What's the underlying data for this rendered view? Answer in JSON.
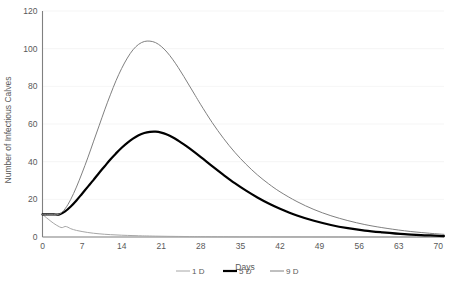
{
  "chart_data": {
    "type": "line",
    "title": "",
    "xlabel": "Days",
    "ylabel": "Number of Infectious Calves",
    "xlim": [
      0,
      71
    ],
    "ylim": [
      0,
      120
    ],
    "grid": true,
    "legend_position": "bottom",
    "xticks": [
      0,
      7,
      14,
      21,
      28,
      35,
      42,
      49,
      56,
      63,
      70
    ],
    "xtick_labels": [
      "0",
      "7",
      "14",
      "21",
      "28",
      "35",
      "42",
      "49",
      "56",
      "63",
      "70"
    ],
    "yticks": [
      0,
      20,
      40,
      60,
      80,
      100,
      120
    ],
    "ytick_labels": [
      "0",
      "20",
      "40",
      "60",
      "80",
      "100",
      "120"
    ],
    "series": [
      {
        "name": "1 D",
        "color": "#a6a6a6",
        "width": 1.0,
        "x": [
          0,
          1,
          2,
          3,
          3.5,
          4,
          4.5,
          5,
          6,
          7,
          8,
          9,
          10,
          11,
          12,
          13,
          14,
          15,
          16,
          17,
          18,
          20,
          22,
          24,
          26,
          28,
          32,
          36,
          42,
          50,
          60,
          71
        ],
        "values": [
          12,
          9.5,
          7.2,
          5.4,
          5.0,
          5.6,
          5.2,
          4.4,
          3.5,
          2.9,
          2.4,
          2.0,
          1.7,
          1.45,
          1.25,
          1.1,
          0.95,
          0.85,
          0.75,
          0.66,
          0.58,
          0.45,
          0.36,
          0.29,
          0.23,
          0.19,
          0.13,
          0.09,
          0.05,
          0.02,
          0.01,
          0.0
        ]
      },
      {
        "name": "5 D",
        "color": "#000000",
        "width": 2.2,
        "x": [
          0,
          1,
          2,
          3,
          4,
          5,
          6,
          7,
          8,
          9,
          10,
          11,
          12,
          13,
          14,
          15,
          16,
          17,
          18,
          19,
          20,
          21,
          22,
          23,
          24,
          25,
          26,
          28,
          30,
          32,
          34,
          36,
          38,
          40,
          42,
          45,
          48,
          51,
          54,
          57,
          60,
          64,
          68,
          71
        ],
        "values": [
          12,
          12,
          12,
          12,
          13.6,
          16.2,
          19.4,
          23.0,
          26.6,
          30.2,
          34.0,
          37.6,
          41.2,
          44.4,
          47.4,
          50.0,
          52.2,
          54.0,
          55.2,
          55.8,
          55.9,
          55.4,
          54.4,
          53.0,
          51.2,
          49.2,
          47.0,
          42.4,
          37.6,
          33.0,
          28.6,
          24.6,
          21.0,
          17.8,
          15.0,
          11.4,
          8.6,
          6.4,
          4.7,
          3.4,
          2.5,
          1.5,
          0.9,
          0.5
        ]
      },
      {
        "name": "9 D",
        "color": "#808080",
        "width": 1.0,
        "x": [
          0,
          1,
          2,
          3,
          4,
          5,
          6,
          7,
          8,
          9,
          10,
          11,
          12,
          13,
          14,
          15,
          16,
          17,
          18,
          19,
          20,
          21,
          22,
          23,
          24,
          25,
          26,
          27,
          28,
          30,
          32,
          34,
          36,
          38,
          40,
          42,
          45,
          48,
          51,
          54,
          57,
          60,
          64,
          68,
          71
        ],
        "values": [
          12,
          12,
          12,
          12.2,
          15.0,
          20.0,
          26.5,
          34.0,
          42.0,
          50.5,
          59.0,
          67.5,
          75.5,
          83.0,
          89.5,
          95.0,
          99.4,
          102.3,
          103.8,
          104.0,
          103.2,
          101.2,
          98.2,
          94.4,
          90.0,
          85.2,
          80.2,
          75.2,
          70.2,
          60.8,
          52.4,
          45.0,
          38.6,
          33.0,
          28.2,
          24.0,
          18.8,
          14.6,
          11.3,
          8.7,
          6.6,
          5.0,
          3.3,
          2.1,
          1.4
        ]
      }
    ]
  },
  "legend": {
    "items": [
      {
        "label": "1 D"
      },
      {
        "label": "5 D"
      },
      {
        "label": "9 D"
      }
    ]
  }
}
